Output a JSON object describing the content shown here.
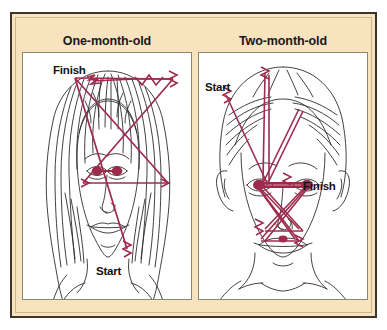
{
  "figure": {
    "name": "infant-face-scanpath-comparison",
    "background_color": "#ffffff",
    "card_background_color": "#f7e3bd",
    "card_border_color": "#3d3328",
    "panel_background_color": "#ffffff",
    "scanpath_color": "#9e2b4e",
    "line_art_color": "#2c2c2c",
    "label_color": "#121217"
  },
  "panels": [
    {
      "id": "one-month-old",
      "title": "One-month-old",
      "annotations": [
        {
          "id": "finish",
          "label": "Finish"
        },
        {
          "id": "start",
          "label": "Start"
        }
      ],
      "scanpath": {
        "description": "Sparse scanpath concentrated along the hairline and outer contour of the face, beginning below the chin and ending above the forehead.",
        "start_point": [
          104,
          196
        ],
        "finish_point": [
          70,
          28
        ],
        "fixation_points": [
          [
            104,
            196
          ],
          [
            52,
            25
          ],
          [
            145,
            130
          ],
          [
            60,
            130
          ],
          [
            150,
            26
          ],
          [
            112,
            26
          ],
          [
            70,
            28
          ]
        ]
      }
    },
    {
      "id": "two-month-old",
      "title": "Two-month-old",
      "annotations": [
        {
          "id": "start",
          "label": "Start"
        },
        {
          "id": "finish",
          "label": "Finish"
        }
      ],
      "scanpath": {
        "description": "Dense scanpath concentrated on internal facial features — eyes, nose and mouth — beginning at the upper-left outside the head and ending near the mouth.",
        "start_point": [
          27,
          42
        ],
        "finish_point": [
          100,
          138
        ],
        "fixation_points": [
          [
            27,
            42
          ],
          [
            68,
            116
          ],
          [
            66,
            20
          ],
          [
            68,
            116
          ],
          [
            96,
            116
          ],
          [
            62,
            140
          ],
          [
            100,
            60
          ],
          [
            66,
            150
          ],
          [
            58,
            148
          ],
          [
            100,
            116
          ],
          [
            60,
            152
          ],
          [
            96,
            140
          ],
          [
            100,
            138
          ]
        ]
      }
    }
  ]
}
